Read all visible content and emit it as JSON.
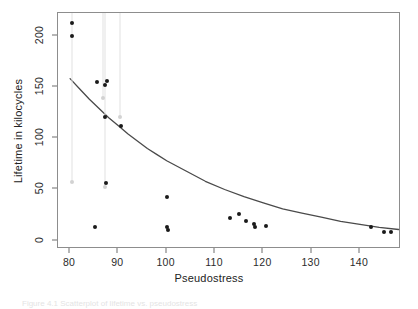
{
  "figure": {
    "caption_fragment": "Figure 4.1  Scatterplot of lifetime vs. pseudostress",
    "xlabel": "Pseudostress",
    "ylabel": "Lifetime in kilocycles"
  },
  "chart_data": {
    "type": "scatter",
    "title": "",
    "xlabel": "Pseudostress",
    "ylabel": "Lifetime in kilocycles",
    "xlim": [
      77.5,
      148.5
    ],
    "ylim": [
      -8,
      222
    ],
    "xticks": [
      80,
      90,
      100,
      110,
      120,
      130,
      140
    ],
    "yticks": [
      0,
      50,
      100,
      150,
      200
    ],
    "grid": false,
    "legend": null,
    "point_color": "#1a1a1a",
    "censored_color": "#d2d2d2",
    "curve_color": "#4a4a4a",
    "series": [
      {
        "name": "observed failures",
        "marker": "filled-circle",
        "points": [
          [
            80.3,
            212
          ],
          [
            80.3,
            200
          ],
          [
            85.5,
            155
          ],
          [
            87.2,
            152
          ],
          [
            87.6,
            156
          ],
          [
            87.3,
            121
          ],
          [
            90.5,
            112
          ],
          [
            87.4,
            56
          ],
          [
            85.2,
            13
          ],
          [
            100.1,
            43
          ],
          [
            100.0,
            13
          ],
          [
            100.2,
            11
          ],
          [
            113.0,
            22
          ],
          [
            115.0,
            26
          ],
          [
            116.5,
            19
          ],
          [
            118.0,
            16
          ],
          [
            118.2,
            13
          ],
          [
            120.5,
            14
          ],
          [
            142.3,
            13
          ],
          [
            145.0,
            9
          ],
          [
            146.5,
            9
          ]
        ]
      },
      {
        "name": "censored observations",
        "marker": "open-circle-light",
        "points": [
          [
            86.9,
            139
          ],
          [
            90.4,
            121
          ],
          [
            80.4,
            57
          ],
          [
            87.2,
            52
          ]
        ]
      }
    ],
    "censoring_lines": [
      {
        "x": 80.4,
        "y_top": 222,
        "y_bottom": 57
      },
      {
        "x": 86.9,
        "y_top": 222,
        "y_bottom": 139
      },
      {
        "x": 87.2,
        "y_top": 222,
        "y_bottom": 52
      },
      {
        "x": 90.4,
        "y_top": 222,
        "y_bottom": 121
      }
    ],
    "fitted_curve": {
      "name": "fitted regression curve",
      "description": "exponential-decay fit",
      "points": [
        [
          80,
          158
        ],
        [
          82,
          148
        ],
        [
          84,
          138
        ],
        [
          86,
          129
        ],
        [
          88,
          120
        ],
        [
          90,
          112
        ],
        [
          92,
          104
        ],
        [
          94,
          97
        ],
        [
          96,
          90
        ],
        [
          98,
          84
        ],
        [
          100,
          78
        ],
        [
          104,
          68
        ],
        [
          108,
          58
        ],
        [
          112,
          50
        ],
        [
          116,
          43
        ],
        [
          120,
          37
        ],
        [
          124,
          31
        ],
        [
          128,
          27
        ],
        [
          132,
          23
        ],
        [
          136,
          19
        ],
        [
          140,
          16
        ],
        [
          144,
          13
        ],
        [
          148,
          11
        ]
      ]
    }
  }
}
